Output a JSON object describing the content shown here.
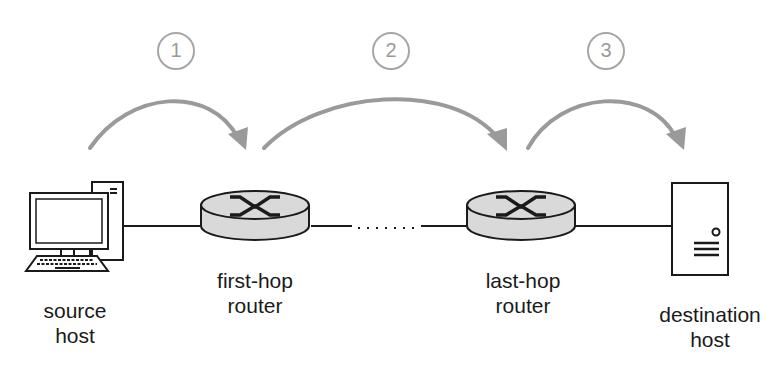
{
  "nodes": [
    {
      "id": "source",
      "label_line1": "source",
      "label_line2": "host",
      "icon": "desktop-computer"
    },
    {
      "id": "first_hop",
      "label_line1": "first-hop",
      "label_line2": "router",
      "icon": "router"
    },
    {
      "id": "last_hop",
      "label_line1": "last-hop",
      "label_line2": "router",
      "icon": "router"
    },
    {
      "id": "destination",
      "label_line1": "destination",
      "label_line2": "host",
      "icon": "server"
    }
  ],
  "steps": [
    {
      "number": "1"
    },
    {
      "number": "2"
    },
    {
      "number": "3"
    }
  ],
  "colors": {
    "arrow": "#9a9a9a",
    "step_circle": "#a6a6a6",
    "router_fill": "#d9d9d9",
    "line": "#1a1a1a"
  }
}
